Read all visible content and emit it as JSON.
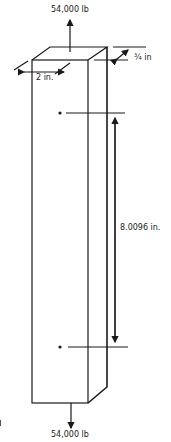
{
  "figure": {
    "load_top": "54,000 lb",
    "load_bottom": "54,000 lb",
    "width_label": "2 in.",
    "thickness_label": "¾ in",
    "gage_length_label": "8.0096 in.",
    "stroke_color": "#1a1a1a",
    "background": "#ffffff"
  }
}
